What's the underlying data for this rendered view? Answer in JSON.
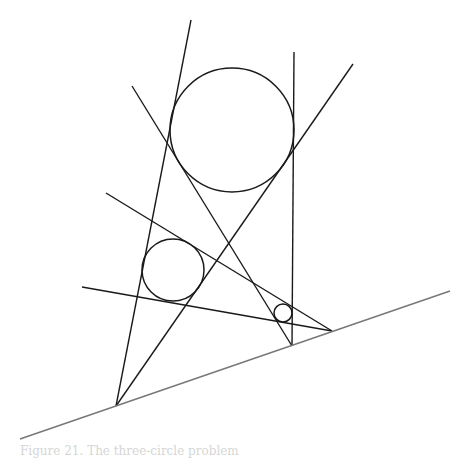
{
  "figure": {
    "stroke": "#1a1a1a",
    "base_stroke": "#777777",
    "circles": [
      {
        "name": "large-circle",
        "cx": 232,
        "cy": 130,
        "r": 62
      },
      {
        "name": "medium-circle",
        "cx": 173,
        "cy": 270,
        "r": 31
      },
      {
        "name": "small-circle",
        "cx": 283,
        "cy": 313,
        "r": 9
      }
    ],
    "lines": [
      {
        "name": "tangent-line-1",
        "x1": 191,
        "y1": 20,
        "x2": 116,
        "y2": 406
      },
      {
        "name": "tangent-line-2",
        "x1": 353,
        "y1": 64,
        "x2": 116,
        "y2": 406
      },
      {
        "name": "tangent-line-3",
        "x1": 294,
        "y1": 52,
        "x2": 292,
        "y2": 346
      },
      {
        "name": "tangent-line-4",
        "x1": 132,
        "y1": 86,
        "x2": 292,
        "y2": 346
      },
      {
        "name": "tangent-line-5",
        "x1": 106,
        "y1": 193,
        "x2": 332,
        "y2": 331
      },
      {
        "name": "tangent-line-6",
        "x1": 82,
        "y1": 287,
        "x2": 332,
        "y2": 331
      }
    ],
    "base_line": {
      "x1": 20,
      "y1": 439,
      "x2": 450,
      "y2": 291
    }
  },
  "caption": "Figure 21. The three-circle problem"
}
